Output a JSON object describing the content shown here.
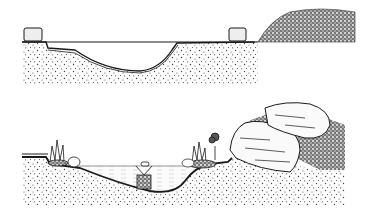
{
  "figure": {
    "type": "cross-section illustration",
    "panels": [
      {
        "id": "top",
        "description": "Excavated pond hole lined with liner, edge stones at both rims, pile of excavated soil to the right",
        "elements": [
          "soil",
          "liner",
          "edge-stone-left",
          "edge-stone-right",
          "soil-pile"
        ]
      },
      {
        "id": "bottom",
        "description": "Finished pond filled with water, marginal plants on shelves, basket plant in center, large rocks and rockery on right",
        "elements": [
          "soil",
          "liner",
          "water",
          "plant-left",
          "pebble",
          "basket-plant",
          "plant-right",
          "small-tree",
          "rock-lower",
          "rock-upper",
          "gravel-fill"
        ]
      }
    ],
    "colors": {
      "ink": "#1a1a1a",
      "paper": "#ffffff",
      "water": "#f4f4f4",
      "rock": "#fafafa"
    }
  }
}
